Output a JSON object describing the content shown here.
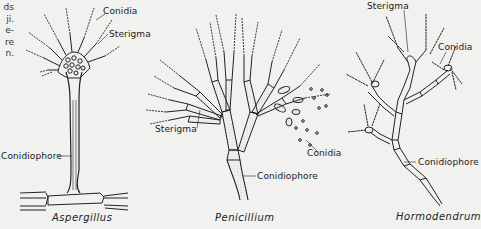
{
  "figure": {
    "left_margin_text_fragments": [
      "ds",
      "ji.",
      "e-",
      "re",
      "n."
    ],
    "panels": [
      {
        "id": "aspergillus",
        "caption": "Aspergillus",
        "labels": {
          "conidia": "Conidia",
          "sterigma": "Sterigma",
          "conidiophore": "Conidiophore"
        }
      },
      {
        "id": "penicillium",
        "caption": "Penicillium",
        "labels": {
          "sterigma": "Sterigma",
          "conidia": "Conidia",
          "conidiophore": "Conidiophore"
        }
      },
      {
        "id": "hormodendrum",
        "caption": "Hormodendrum",
        "labels": {
          "sterigma": "Sterigma",
          "conidia": "Conidia",
          "conidiophore": "Conidiophore"
        }
      }
    ]
  },
  "colors": {
    "background": "#f1f1ef",
    "ink": "#222222",
    "stipple": "#9a9a9a"
  }
}
